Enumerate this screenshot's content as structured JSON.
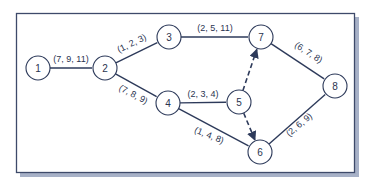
{
  "diagram": {
    "type": "network",
    "colors": {
      "line": "#2d3a5a",
      "node_fill": "#ffffff",
      "frame": "#3e4a6a",
      "shadow": "#8a97b4",
      "text": "#2a3450"
    },
    "nodes": [
      {
        "id": "1",
        "label": "1",
        "x": 38,
        "y": 68
      },
      {
        "id": "2",
        "label": "2",
        "x": 105,
        "y": 68
      },
      {
        "id": "3",
        "label": "3",
        "x": 169,
        "y": 37
      },
      {
        "id": "4",
        "label": "4",
        "x": 168,
        "y": 103
      },
      {
        "id": "5",
        "label": "5",
        "x": 239,
        "y": 102
      },
      {
        "id": "6",
        "label": "6",
        "x": 260,
        "y": 152
      },
      {
        "id": "7",
        "label": "7",
        "x": 261,
        "y": 37
      },
      {
        "id": "8",
        "label": "8",
        "x": 335,
        "y": 86
      }
    ],
    "edges": [
      {
        "from": "1",
        "to": "2",
        "label": "(7, 9, 11)",
        "style": "solid"
      },
      {
        "from": "2",
        "to": "3",
        "label": "(1, 2, 3)",
        "style": "solid"
      },
      {
        "from": "2",
        "to": "4",
        "label": "(7, 8, 9)",
        "style": "solid"
      },
      {
        "from": "3",
        "to": "7",
        "label": "(2, 5, 11)",
        "style": "solid"
      },
      {
        "from": "4",
        "to": "5",
        "label": "(2, 3, 4)",
        "style": "solid"
      },
      {
        "from": "4",
        "to": "6",
        "label": "(1, 4, 8)",
        "style": "solid"
      },
      {
        "from": "5",
        "to": "7",
        "label": "",
        "style": "dashed-arrow"
      },
      {
        "from": "5",
        "to": "6",
        "label": "",
        "style": "dashed-arrow"
      },
      {
        "from": "7",
        "to": "8",
        "label": "(6, 7, 8)",
        "style": "solid"
      },
      {
        "from": "6",
        "to": "8",
        "label": "(2, 6, 9)",
        "style": "solid"
      }
    ]
  }
}
